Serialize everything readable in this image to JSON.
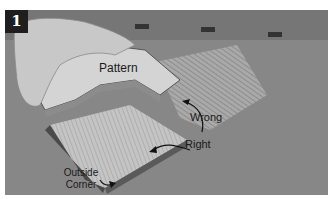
{
  "figure": {
    "step_number": "1",
    "labels": {
      "pattern": "Pattern",
      "wrong": "Wrong",
      "right": "Right",
      "outside_corner": "Outside\nCorner"
    },
    "outside_corner_lines": [
      "Outside",
      "Corner"
    ]
  }
}
